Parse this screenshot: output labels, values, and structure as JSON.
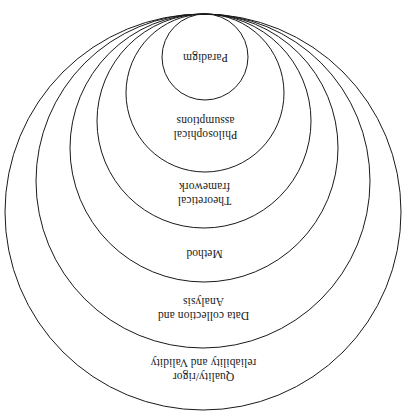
{
  "diagram": {
    "type": "concentric-tangent-circles",
    "orientation": "inverted-text",
    "canvas": {
      "width": 405,
      "height": 413
    },
    "style": {
      "stroke_color": "#1a1a1a",
      "fill_color": "none",
      "background_color": "#ffffff",
      "stroke_width": 1
    },
    "tangent_point": {
      "x": 205,
      "y": 14
    },
    "layers": [
      {
        "index": 1,
        "label": "Paradigm",
        "level": "innermost",
        "cx": 205,
        "cy": 57,
        "r": 43,
        "label_x": 205,
        "label_y": 58,
        "font_size": 11.5
      },
      {
        "index": 2,
        "label": "Philosophical\nassumptions",
        "level": "second",
        "cx": 205,
        "cy": 93,
        "r": 79,
        "label_x": 205,
        "label_y": 128,
        "font_size": 11.5
      },
      {
        "index": 3,
        "label": "Theoretical\nframework",
        "level": "third",
        "cx": 204,
        "cy": 121,
        "r": 107,
        "label_x": 204,
        "label_y": 194,
        "font_size": 11.5
      },
      {
        "index": 4,
        "label": "Method",
        "level": "fourth",
        "cx": 204,
        "cy": 148,
        "r": 134,
        "label_x": 204,
        "label_y": 254,
        "font_size": 11.5
      },
      {
        "index": 5,
        "label": "Data collection and\nAnalysis",
        "level": "fifth",
        "cx": 203,
        "cy": 181,
        "r": 167,
        "label_x": 203,
        "label_y": 309,
        "font_size": 11.5
      },
      {
        "index": 6,
        "label": "Quality/rigor\nreliability and Validity",
        "level": "outermost",
        "cx": 203,
        "cy": 212,
        "r": 198,
        "label_x": 203,
        "label_y": 370,
        "font_size": 11.5
      }
    ]
  }
}
